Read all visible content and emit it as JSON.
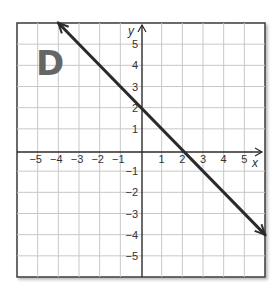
{
  "panel": {
    "label": "D"
  },
  "chart_data": {
    "type": "line",
    "title": "",
    "panel_label": "D",
    "xlabel": "x",
    "ylabel": "y",
    "xlim": [
      -6,
      6
    ],
    "ylim": [
      -6,
      6
    ],
    "grid": true,
    "x_tick_labels": [
      "-5",
      "-4",
      "-3",
      "-2",
      "-1",
      "1",
      "2",
      "3",
      "4",
      "5"
    ],
    "y_tick_labels": [
      "5",
      "4",
      "3",
      "2",
      "1",
      "-1",
      "-2",
      "-3",
      "-4",
      "-5"
    ],
    "series": [
      {
        "name": "y = -x + 2",
        "slope": -1,
        "intercept": 2,
        "x": [
          -4,
          -2,
          0,
          2,
          4,
          6
        ],
        "y": [
          6,
          4,
          2,
          0,
          -2,
          -4
        ],
        "arrows_both_ends": true,
        "color": "#2b2b2b"
      }
    ],
    "key_points": {
      "y_intercept": [
        0,
        2
      ],
      "x_intercept": [
        2,
        0
      ]
    }
  },
  "colors": {
    "grid": "#c8c8c8",
    "frame": "#3a3a3a",
    "axis": "#2b2b2b",
    "line": "#2b2b2b",
    "label": "#666666"
  }
}
